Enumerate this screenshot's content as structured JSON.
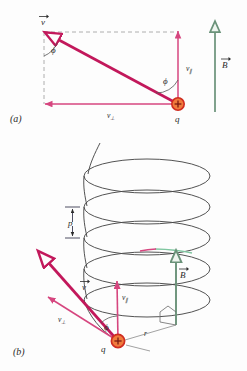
{
  "figure": {
    "panels": [
      {
        "id": "a",
        "label": "(a)",
        "description": "Velocity vector resolved into components parallel and perpendicular to B"
      },
      {
        "id": "b",
        "label": "(b)",
        "description": "Helical path of the charged particle around the magnetic field direction"
      }
    ]
  },
  "labels": {
    "panel_a": "(a)",
    "panel_b": "(b)",
    "velocity": "v",
    "velocity_parallel": "v",
    "velocity_parallel_sub": "∥",
    "velocity_perp": "v",
    "velocity_perp_sub": "⊥",
    "magnetic_field": "B",
    "charge": "q",
    "angle": "ϕ",
    "pitch": "p",
    "radius": "r",
    "charge_sign": "+"
  },
  "colors": {
    "velocity_vector": "#c2185b",
    "velocity_component": "#d6467f",
    "magnetic_field": "#6a9279",
    "charge_fill": "#f07a3c",
    "charge_stroke": "#cf2c20",
    "helix": "#4a4a4a",
    "dashed_guide": "#9a9a9a",
    "angle_arc": "#555555",
    "background": "#fdfdfd",
    "text": "#2b2b2b"
  },
  "geometry": {
    "panel_a": {
      "charge_position": [
        178,
        104
      ],
      "velocity_tip": [
        44,
        32
      ],
      "v_parallel_tip": [
        178,
        32
      ],
      "v_perp_tip": [
        44,
        104
      ],
      "b_field_base": [
        215,
        112
      ],
      "b_field_tip": [
        215,
        19
      ]
    },
    "panel_b": {
      "charge_position": [
        118,
        341
      ],
      "velocity_tip": [
        37,
        250
      ],
      "v_perp_tip": [
        46,
        295
      ],
      "v_parallel_tip": [
        117,
        278
      ],
      "b_field_base": [
        176,
        325
      ],
      "b_field_tip": [
        176,
        248
      ],
      "helix_turns": 4,
      "helix_center_x": 147,
      "helix_rx": 63,
      "helix_ry": 17,
      "pitch_marker_x": 72,
      "pitch_top_y": 207,
      "pitch_bottom_y": 238
    }
  }
}
